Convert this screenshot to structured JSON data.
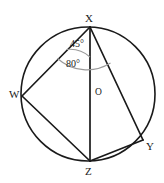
{
  "figure": {
    "type": "circle-geometry-diagram",
    "background_color": "#ffffff",
    "stroke_color": "#1a1a1a",
    "arc_color": "#8a8a8a",
    "circle": {
      "center_label": "O",
      "cx": 88,
      "cy": 94,
      "r": 67
    },
    "vertices": [
      {
        "label": "X",
        "x": 90,
        "y": 27
      },
      {
        "label": "W",
        "x": 22,
        "y": 96
      },
      {
        "label": "Y",
        "x": 143,
        "y": 140
      },
      {
        "label": "Z",
        "x": 90,
        "y": 161
      }
    ],
    "chords": [
      {
        "name": "chord-XW",
        "from": "X",
        "to": "W"
      },
      {
        "name": "chord-XZ",
        "from": "X",
        "to": "Z"
      },
      {
        "name": "chord-XY",
        "from": "X",
        "to": "Y"
      },
      {
        "name": "chord-WZ",
        "from": "W",
        "to": "Z"
      },
      {
        "name": "chord-ZY",
        "from": "Z",
        "to": "Y"
      }
    ],
    "angles": [
      {
        "name": "angle-WXZ",
        "value": "45°",
        "vertex": "X",
        "between": [
          "W",
          "Z"
        ]
      },
      {
        "name": "angle-WXY",
        "value": "80°",
        "vertex": "X",
        "between": [
          "W",
          "Y"
        ]
      }
    ]
  }
}
